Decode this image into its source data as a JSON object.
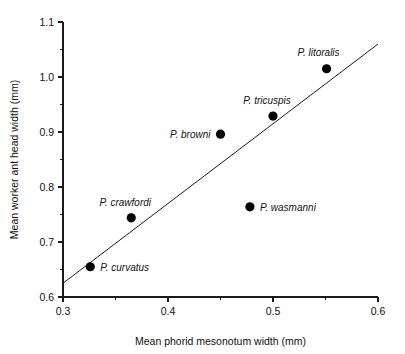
{
  "chart_data": {
    "type": "scatter",
    "title": "",
    "xlabel": "Mean phorid mesonotum width (mm)",
    "ylabel": "Mean worker ant head width (mm)",
    "xlim": [
      0.3,
      0.6
    ],
    "ylim": [
      0.6,
      1.1
    ],
    "grid": false,
    "legend_position": "none",
    "x_ticks": [
      "0.3",
      "0.4",
      "0.5",
      "0.6"
    ],
    "x_tick_values": [
      0.3,
      0.4,
      0.5,
      0.6
    ],
    "x_minor_tick_values": [
      0.35,
      0.45,
      0.55
    ],
    "y_ticks": [
      "0.6",
      "0.7",
      "0.8",
      "0.9",
      "1.0",
      "1.1"
    ],
    "y_tick_values": [
      0.6,
      0.7,
      0.8,
      0.9,
      1.0,
      1.1
    ],
    "y_minor_tick_values": [
      0.65,
      0.75,
      0.85,
      0.95,
      1.05
    ],
    "points": [
      {
        "label": "P. curvatus",
        "x": 0.326,
        "y": 0.655,
        "label_dx": 10,
        "label_dy": 4,
        "label_anchor": "start"
      },
      {
        "label": "P. crawfordi",
        "x": 0.365,
        "y": 0.744,
        "label_dx": -6,
        "label_dy": -12,
        "label_anchor": "middle"
      },
      {
        "label": "P. wasmanni",
        "x": 0.478,
        "y": 0.764,
        "label_dx": 10,
        "label_dy": 4,
        "label_anchor": "start"
      },
      {
        "label": "P. browni",
        "x": 0.45,
        "y": 0.896,
        "label_dx": -10,
        "label_dy": 4,
        "label_anchor": "end"
      },
      {
        "label": "P. tricuspis",
        "x": 0.5,
        "y": 0.929,
        "label_dx": -6,
        "label_dy": -12,
        "label_anchor": "middle"
      },
      {
        "label": "P. litoralis",
        "x": 0.551,
        "y": 1.015,
        "label_dx": -8,
        "label_dy": -13,
        "label_anchor": "middle"
      }
    ],
    "trend_line": {
      "type": "linear-fit",
      "x_start": 0.3,
      "y_start": 0.625,
      "x_end": 0.6,
      "y_end": 1.06
    }
  },
  "figure": {
    "background_color": "#ffffff",
    "axis_color": "#1a1a1a",
    "point_color": "#000000",
    "line_color": "#1a1a1a"
  }
}
